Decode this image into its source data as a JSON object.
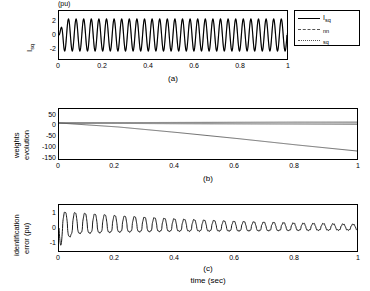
{
  "figure": {
    "xlabel": "time (sec)",
    "panels": [
      {
        "id": "a",
        "caption": "(a)",
        "ylabel_main": "I",
        "ylabel_sub": "sq",
        "ylabel_unit": "(pu)",
        "unit_text": "(pu)",
        "yticks": [
          "2",
          "0",
          "-2"
        ],
        "xticks": [
          "0",
          "0.2",
          "0.4",
          "0.6",
          "0.8",
          "1"
        ],
        "ylim": [
          -3,
          3
        ],
        "xlim": [
          0,
          1
        ]
      },
      {
        "id": "b",
        "caption": "(b)",
        "ylabel_line1": "weights",
        "ylabel_line2": "evolution",
        "yticks": [
          "50",
          "0",
          "-50",
          "-100",
          "-150"
        ],
        "xticks": [
          "0",
          "0.2",
          "0.4",
          "0.6",
          "0.8",
          "1"
        ],
        "ylim": [
          -180,
          70
        ],
        "xlim": [
          0,
          1
        ]
      },
      {
        "id": "c",
        "caption": "(c)",
        "ylabel_line1": "identification",
        "ylabel_line2": "error (pu)",
        "yticks": [
          "1",
          "0",
          "-1"
        ],
        "xticks": [
          "0",
          "0.2",
          "0.4",
          "0.6",
          "0.8",
          "1"
        ],
        "ylim": [
          -1.4,
          1.4
        ],
        "xlim": [
          0,
          1
        ]
      }
    ],
    "legend": {
      "items": [
        {
          "label": "I",
          "sub": "sq",
          "style": "solid-thick"
        },
        {
          "label": "",
          "sub": "nn",
          "style": "dashed"
        },
        {
          "label": "",
          "sub": "sq",
          "style": "dotted"
        }
      ]
    }
  },
  "chart_data": {
    "type": "line",
    "title": "",
    "xlabel": "time (sec)",
    "subplots": [
      {
        "id": "a",
        "ylabel": "Isq (pu)",
        "xlim": [
          0,
          1
        ],
        "ylim": [
          -3,
          3
        ],
        "yticks": [
          2,
          0,
          -2
        ],
        "xticks": [
          0,
          0.2,
          0.4,
          0.6,
          0.8,
          1
        ],
        "legend": [
          "Isq",
          "nn",
          "sq"
        ],
        "description": "Oscillating sinusoidal current Isq, about 30 cycles over 1 s, amplitude roughly 2 pu, starting near 0",
        "series": [
          {
            "name": "Isq",
            "style": "solid",
            "frequency_hz": 30,
            "amplitude": 2.0,
            "offset": 0.0
          },
          {
            "name": "nn",
            "style": "dashed",
            "frequency_hz": 30,
            "amplitude": 1.9,
            "offset": 0.0
          }
        ]
      },
      {
        "id": "b",
        "ylabel": "weights evolution",
        "xlim": [
          0,
          1
        ],
        "ylim": [
          -180,
          70
        ],
        "yticks": [
          50,
          0,
          -50,
          -100,
          -150
        ],
        "xticks": [
          0,
          0.2,
          0.4,
          0.6,
          0.8,
          1
        ],
        "description": "Several weight traces: most stay near 0, one drifts steadily down to about -140 at t = 1 s",
        "series": [
          {
            "name": "w1",
            "x": [
              0,
              0.2,
              0.4,
              0.6,
              0.8,
              1.0
            ],
            "values": [
              0,
              -2,
              -4,
              -5,
              -6,
              -7
            ]
          },
          {
            "name": "w2",
            "x": [
              0,
              0.2,
              0.4,
              0.6,
              0.8,
              1.0
            ],
            "values": [
              0,
              2,
              3,
              4,
              5,
              5
            ]
          },
          {
            "name": "w3",
            "x": [
              0,
              0.2,
              0.4,
              0.6,
              0.8,
              1.0
            ],
            "values": [
              0,
              -20,
              -48,
              -78,
              -110,
              -140
            ]
          },
          {
            "name": "w4",
            "x": [
              0,
              0.2,
              0.4,
              0.6,
              0.8,
              1.0
            ],
            "values": [
              0,
              0,
              0,
              0,
              0,
              0
            ]
          }
        ]
      },
      {
        "id": "c",
        "ylabel": "identification error (pu)",
        "xlim": [
          0,
          1
        ],
        "ylim": [
          -1.4,
          1.4
        ],
        "yticks": [
          1,
          0,
          -1
        ],
        "xticks": [
          0,
          0.2,
          0.4,
          0.6,
          0.8,
          1
        ],
        "description": "Identification error: large spike near t=0 reaching about -1, then decaying oscillatory error from about +1 down to +0.2 by t = 1 s",
        "series": [
          {
            "name": "identification error",
            "style": "solid",
            "envelope_x": [
              0,
              0.05,
              0.2,
              0.4,
              0.6,
              0.8,
              1.0
            ],
            "envelope_peak": [
              1.0,
              0.95,
              0.75,
              0.55,
              0.4,
              0.3,
              0.22
            ],
            "envelope_trough": [
              -1.05,
              -0.35,
              -0.25,
              -0.2,
              -0.18,
              -0.15,
              -0.12
            ]
          }
        ]
      }
    ]
  }
}
